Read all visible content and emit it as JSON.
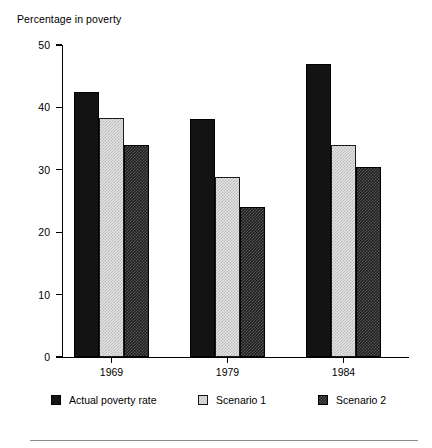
{
  "chart_data": {
    "type": "bar",
    "title": "Percentage in poverty",
    "xlabel": "",
    "ylabel": "Percentage in poverty",
    "categories": [
      "1969",
      "1979",
      "1984"
    ],
    "series": [
      {
        "name": "Actual poverty rate",
        "values": [
          42.5,
          38.2,
          47.0
        ],
        "swatch": "solid-black"
      },
      {
        "name": "Scenario 1",
        "values": [
          38.3,
          28.8,
          34.0
        ],
        "swatch": "light-stipple"
      },
      {
        "name": "Scenario 2",
        "values": [
          34.0,
          24.0,
          30.5
        ],
        "swatch": "dark-stipple"
      }
    ],
    "ylim": [
      0,
      50
    ],
    "yticks": [
      0,
      10,
      20,
      30,
      40,
      50
    ],
    "ytick_labels": [
      "0",
      "10",
      "20",
      "30",
      "40",
      "50"
    ],
    "grid": false,
    "legend_position": "bottom"
  },
  "legend": {
    "items": [
      {
        "label": "Actual poverty rate"
      },
      {
        "label": "Scenario 1"
      },
      {
        "label": "Scenario 2"
      }
    ]
  }
}
